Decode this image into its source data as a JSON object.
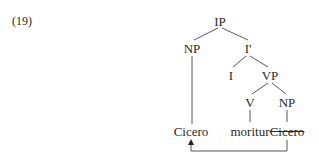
{
  "example_number": "(19)",
  "tree": {
    "nodes": {
      "ip": "IP",
      "np_subject": "NP",
      "i_bar": "I'",
      "i": "I",
      "vp": "VP",
      "v": "V",
      "np_object": "NP"
    },
    "leaves": {
      "moved": "Cicero",
      "verb": "moritur",
      "trace": "Cicero"
    }
  },
  "movement_arrow": {
    "from": "trace",
    "to": "moved"
  }
}
